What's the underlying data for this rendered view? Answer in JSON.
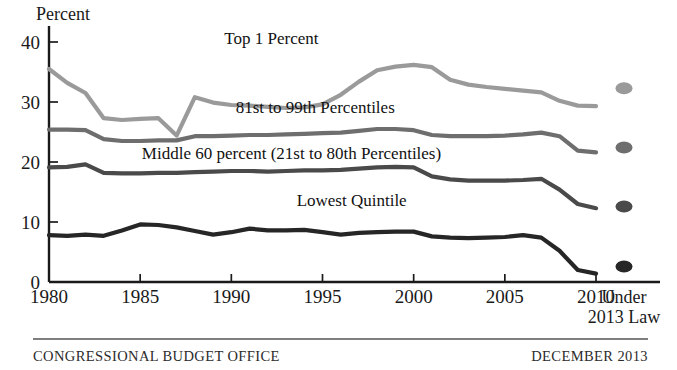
{
  "figure": {
    "y_axis_title": "Percent",
    "footer_left": "CONGRESSIONAL BUDGET OFFICE",
    "footer_right": "DECEMBER 2013",
    "projection_label_line1": "Under",
    "projection_label_line2": "2013 Law"
  },
  "colors": {
    "top1": "#9a9a9a",
    "p81_99": "#6e6e6e",
    "middle60": "#4a4a4a",
    "lowest": "#262626",
    "axis": "#1a1a1a",
    "text": "#1a1a1a",
    "footer_rule": "#555555"
  },
  "chart_data": {
    "type": "line",
    "title": "",
    "xlabel": "",
    "ylabel": "Percent",
    "xlim": [
      1980,
      2010
    ],
    "ylim": [
      0,
      42
    ],
    "yticks": [
      0,
      10,
      20,
      30,
      40
    ],
    "ytick_labels": [
      "0",
      "10",
      "20",
      "30",
      "40"
    ],
    "xticks": [
      1980,
      1985,
      1990,
      1995,
      2000,
      2005,
      2010
    ],
    "xtick_labels": [
      "1980",
      "1985",
      "1990",
      "1995",
      "2000",
      "2005",
      "2010"
    ],
    "grid": false,
    "legend": "inline-annotations",
    "x": [
      1980,
      1981,
      1982,
      1983,
      1984,
      1985,
      1986,
      1987,
      1988,
      1989,
      1990,
      1991,
      1992,
      1993,
      1994,
      1995,
      1996,
      1997,
      1998,
      1999,
      2000,
      2001,
      2002,
      2003,
      2004,
      2005,
      2006,
      2007,
      2008,
      2009,
      2010
    ],
    "series": [
      {
        "name": "Top 1 Percent",
        "color": "#9a9a9a",
        "label": "Top 1 Percent",
        "label_x": 1992.2,
        "label_y": 39.6,
        "values": [
          35.5,
          33.2,
          31.5,
          27.3,
          27.0,
          27.2,
          27.3,
          24.4,
          30.8,
          29.9,
          29.5,
          29.4,
          29.2,
          29.0,
          29.1,
          29.6,
          31.2,
          33.4,
          35.3,
          35.9,
          36.2,
          35.8,
          33.7,
          32.9,
          32.5,
          32.2,
          31.9,
          31.6,
          30.2,
          29.4,
          29.3
        ],
        "projection_2013law": 32.3
      },
      {
        "name": "81st to 99th Percentiles",
        "color": "#6e6e6e",
        "label": "81st to 99th Percentiles",
        "label_x": 1994.6,
        "label_y": 28.1,
        "values": [
          25.4,
          25.4,
          25.3,
          23.8,
          23.5,
          23.5,
          23.6,
          23.6,
          24.3,
          24.3,
          24.4,
          24.5,
          24.5,
          24.6,
          24.7,
          24.8,
          24.9,
          25.2,
          25.5,
          25.5,
          25.3,
          24.5,
          24.3,
          24.3,
          24.3,
          24.4,
          24.6,
          24.9,
          24.3,
          21.9,
          21.6
        ],
        "projection_2013law": 22.4
      },
      {
        "name": "Middle 60 percent (21st to 80th Percentiles)",
        "color": "#4a4a4a",
        "label": "Middle 60 percent (21st to 80th Percentiles)",
        "label_x": 1993.3,
        "label_y": 20.5,
        "values": [
          19.1,
          19.2,
          19.6,
          18.2,
          18.1,
          18.1,
          18.2,
          18.2,
          18.3,
          18.4,
          18.5,
          18.5,
          18.4,
          18.5,
          18.6,
          18.6,
          18.7,
          18.9,
          19.1,
          19.2,
          19.1,
          17.6,
          17.1,
          16.9,
          16.9,
          16.9,
          17.0,
          17.2,
          15.4,
          13.0,
          12.3
        ],
        "projection_2013law": 12.6
      },
      {
        "name": "Lowest Quintile",
        "color": "#262626",
        "label": "Lowest Quintile",
        "label_x": 1996.6,
        "label_y": 12.6,
        "values": [
          7.8,
          7.7,
          7.9,
          7.7,
          8.6,
          9.6,
          9.5,
          9.1,
          8.5,
          7.9,
          8.3,
          8.9,
          8.6,
          8.6,
          8.7,
          8.3,
          7.9,
          8.2,
          8.3,
          8.4,
          8.4,
          7.6,
          7.4,
          7.3,
          7.4,
          7.5,
          7.8,
          7.4,
          5.2,
          2.0,
          1.4
        ],
        "projection_2013law": 2.6
      }
    ]
  }
}
